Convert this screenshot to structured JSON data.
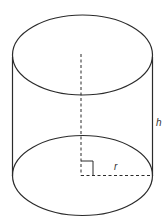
{
  "diagram": {
    "type": "cylinder",
    "labels": {
      "height": "h",
      "radius": "r"
    },
    "colors": {
      "stroke": "#2b2b2b",
      "background": "#ffffff"
    }
  }
}
